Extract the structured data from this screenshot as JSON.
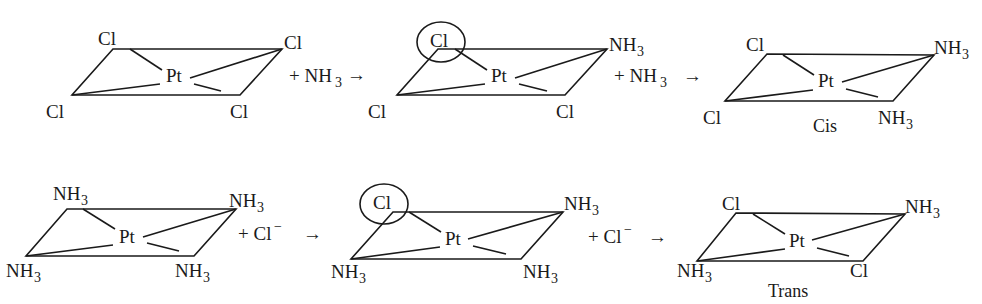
{
  "diagram": {
    "central_atom": "Pt",
    "rows": [
      {
        "name": "cis-route",
        "complexes": [
          {
            "id": "c1",
            "ligands": {
              "top_left": "Cl",
              "top_right": "Cl",
              "bottom_left": "Cl",
              "bottom_right": "Cl"
            },
            "circled": null,
            "caption": null
          },
          {
            "id": "c2",
            "ligands": {
              "top_left": "Cl",
              "top_right": "NH3",
              "bottom_left": "Cl",
              "bottom_right": "Cl"
            },
            "circled": "top_left",
            "caption": null
          },
          {
            "id": "c3",
            "ligands": {
              "top_left": "Cl",
              "top_right": "NH3",
              "bottom_left": "Cl",
              "bottom_right": "NH3"
            },
            "circled": null,
            "caption": "Cis"
          }
        ],
        "reagents": [
          "+ NH3",
          "+ NH3"
        ]
      },
      {
        "name": "trans-route",
        "complexes": [
          {
            "id": "t1",
            "ligands": {
              "top_left": "NH3",
              "top_right": "NH3",
              "bottom_left": "NH3",
              "bottom_right": "NH3"
            },
            "circled": null,
            "caption": null
          },
          {
            "id": "t2",
            "ligands": {
              "top_left": "Cl",
              "top_right": "NH3",
              "bottom_left": "NH3",
              "bottom_right": "NH3"
            },
            "circled": "top_left",
            "caption": null
          },
          {
            "id": "t3",
            "ligands": {
              "top_left": "Cl",
              "top_right": "NH3",
              "bottom_left": "NH3",
              "bottom_right": "Cl"
            },
            "circled": null,
            "caption": "Trans"
          }
        ],
        "reagents": [
          "+ Cl−",
          "+ Cl−"
        ]
      }
    ],
    "arrow": "→",
    "labels": {
      "Pt": "Pt",
      "Cl": "Cl",
      "NH": "NH",
      "sub3": "3",
      "plus_nh3": "+ NH",
      "plus_cl": "+ Cl",
      "minus": "−",
      "cis": "Cis",
      "trans": "Trans",
      "arrow": "→"
    }
  }
}
